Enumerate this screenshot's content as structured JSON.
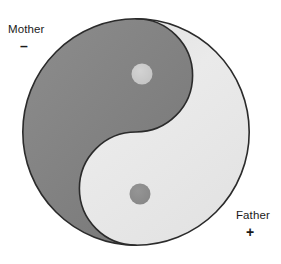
{
  "figure": {
    "type": "taiji-yin-yang-diagram",
    "background_color": "#FFFFFF",
    "outline_color": "#2B2B2B",
    "labels": {
      "mother": {
        "text": "Mother",
        "sign": "–",
        "polarity": "negative",
        "associated_lobe": "dark"
      },
      "father": {
        "text": "Father",
        "sign": "+",
        "polarity": "positive",
        "associated_lobe": "light"
      }
    },
    "lobes": {
      "dark": {
        "name": "yin-dark-lobe",
        "fill": "#808080",
        "dot_fill": "#C9C9C9"
      },
      "light": {
        "name": "yang-light-lobe",
        "fill": "#E9E9E9",
        "dot_fill": "#8C8C8C"
      }
    },
    "geometry": {
      "center_x": 136,
      "center_y": 132,
      "radius": 114,
      "dark_dot": {
        "cx": 142,
        "cy": 74,
        "r": 10
      },
      "light_dot": {
        "cx": 140,
        "cy": 194,
        "r": 10
      }
    }
  }
}
